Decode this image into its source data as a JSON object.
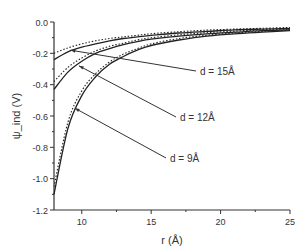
{
  "chart_data": {
    "type": "line",
    "title": "",
    "xlabel": "r (Å)",
    "ylabel": "ψ_ind (V)",
    "xlim": [
      8,
      25
    ],
    "ylim": [
      -1.2,
      0.0
    ],
    "xticks": [
      10,
      15,
      20,
      25
    ],
    "yticks": [
      0.0,
      -0.2,
      -0.4,
      -0.6,
      -0.8,
      -1.0,
      -1.2
    ],
    "xtick_labels": [
      "10",
      "15",
      "20",
      "25"
    ],
    "ytick_labels": [
      "0.0",
      "-0.2",
      "-0.4",
      "-0.6",
      "-0.8",
      "-1.0",
      "-1.2"
    ],
    "grid": false,
    "legend": "annotations with arrows",
    "x": [
      8,
      9,
      10,
      11,
      12,
      13,
      14,
      15,
      17,
      19,
      21,
      23,
      25
    ],
    "series": [
      {
        "name": "d = 15Å (solid)",
        "style": "solid",
        "values": [
          -0.24,
          -0.19,
          -0.16,
          -0.14,
          -0.12,
          -0.105,
          -0.095,
          -0.085,
          -0.07,
          -0.06,
          -0.05,
          -0.045,
          -0.04
        ]
      },
      {
        "name": "d = 15Å (dotted)",
        "style": "dotted",
        "values": [
          -0.2,
          -0.165,
          -0.14,
          -0.12,
          -0.105,
          -0.095,
          -0.085,
          -0.075,
          -0.062,
          -0.052,
          -0.045,
          -0.04,
          -0.035
        ]
      },
      {
        "name": "d = 12Å (solid)",
        "style": "solid",
        "values": [
          -0.43,
          -0.32,
          -0.25,
          -0.2,
          -0.17,
          -0.145,
          -0.125,
          -0.11,
          -0.09,
          -0.075,
          -0.065,
          -0.055,
          -0.05
        ]
      },
      {
        "name": "d = 12Å (dotted)",
        "style": "dotted",
        "values": [
          -0.38,
          -0.29,
          -0.23,
          -0.185,
          -0.155,
          -0.135,
          -0.115,
          -0.1,
          -0.082,
          -0.068,
          -0.058,
          -0.05,
          -0.045
        ]
      },
      {
        "name": "d = 9Å (solid)",
        "style": "solid",
        "values": [
          -1.1,
          -0.68,
          -0.47,
          -0.35,
          -0.27,
          -0.22,
          -0.18,
          -0.15,
          -0.115,
          -0.09,
          -0.075,
          -0.065,
          -0.055
        ]
      },
      {
        "name": "d = 9Å (dotted)",
        "style": "dotted",
        "values": [
          -1.05,
          -0.64,
          -0.44,
          -0.33,
          -0.255,
          -0.205,
          -0.17,
          -0.14,
          -0.105,
          -0.085,
          -0.07,
          -0.06,
          -0.05
        ]
      }
    ],
    "annotations": [
      {
        "text": "d = 15Å",
        "arrow_to": [
          9.2,
          -0.18
        ]
      },
      {
        "text": "d = 12Å",
        "arrow_to": [
          9.8,
          -0.28
        ]
      },
      {
        "text": "d = 9Å",
        "arrow_to": [
          9.5,
          -0.55
        ]
      }
    ]
  }
}
